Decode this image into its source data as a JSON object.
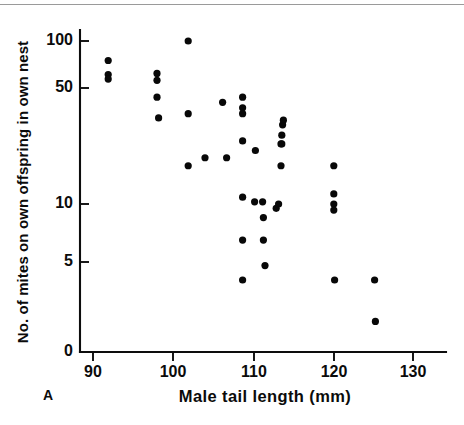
{
  "figure": {
    "panel_label": "A",
    "background_color": "#ffffff",
    "ink_color": "#080808",
    "rule_color": "#9a9a9a"
  },
  "chart_data": {
    "type": "scatter",
    "title": "",
    "xlabel": "Male tail length (mm)",
    "ylabel": "No. of mites on own offspring in own nest",
    "xlim": [
      88,
      132
    ],
    "ylim": [
      0,
      110
    ],
    "grid": false,
    "legend": null,
    "xticks": [
      90,
      100,
      110,
      120,
      130
    ],
    "xticklabels": [
      "90",
      "100",
      "110",
      "120",
      "130"
    ],
    "yticks": [
      0,
      5,
      10,
      50,
      100
    ],
    "yticklabels": [
      "0",
      "5",
      "10",
      "50",
      "100"
    ],
    "yscale": "log-like (0, 5, 10, 50, 100)",
    "marker": "filled-circle",
    "marker_color": "#080808",
    "x": [
      91.9,
      91.9,
      91.9,
      98.0,
      98.0,
      98.0,
      98.2,
      101.9,
      101.9,
      101.9,
      104.0,
      106.2,
      106.7,
      108.7,
      108.7,
      108.7,
      108.7,
      108.7,
      108.7,
      108.7,
      108.8,
      110.2,
      110.3,
      111.2,
      111.3,
      111.3,
      111.5,
      112.9,
      113.2,
      113.5,
      113.5,
      113.6,
      113.6,
      113.7,
      113.8,
      120.1,
      120.1,
      120.1,
      120.1,
      120.2,
      125.2,
      125.3
    ],
    "y": [
      75,
      61,
      57,
      62,
      56,
      44,
      33,
      100,
      35,
      17,
      19,
      41,
      19,
      44,
      38,
      35,
      24,
      11,
      6.5,
      4,
      11,
      10.3,
      21,
      10.3,
      8.5,
      6.5,
      4.8,
      9.5,
      10,
      17,
      23,
      23,
      26,
      30,
      32,
      17,
      11.5,
      10,
      9.3,
      4,
      4,
      1.7
    ],
    "points": [
      {
        "x": 91.9,
        "y": 75
      },
      {
        "x": 91.9,
        "y": 61
      },
      {
        "x": 91.9,
        "y": 57
      },
      {
        "x": 98.0,
        "y": 62
      },
      {
        "x": 98.0,
        "y": 56
      },
      {
        "x": 98.0,
        "y": 44
      },
      {
        "x": 98.2,
        "y": 33
      },
      {
        "x": 101.9,
        "y": 100
      },
      {
        "x": 101.9,
        "y": 35
      },
      {
        "x": 101.9,
        "y": 17
      },
      {
        "x": 104.0,
        "y": 19
      },
      {
        "x": 106.2,
        "y": 41
      },
      {
        "x": 106.7,
        "y": 19
      },
      {
        "x": 108.7,
        "y": 44
      },
      {
        "x": 108.7,
        "y": 38
      },
      {
        "x": 108.7,
        "y": 35
      },
      {
        "x": 108.7,
        "y": 24
      },
      {
        "x": 108.7,
        "y": 11
      },
      {
        "x": 108.7,
        "y": 6.5
      },
      {
        "x": 108.7,
        "y": 4
      },
      {
        "x": 110.2,
        "y": 10.3
      },
      {
        "x": 110.3,
        "y": 21
      },
      {
        "x": 111.2,
        "y": 10.3
      },
      {
        "x": 111.3,
        "y": 8.5
      },
      {
        "x": 111.3,
        "y": 6.5
      },
      {
        "x": 111.5,
        "y": 4.8
      },
      {
        "x": 112.9,
        "y": 9.5
      },
      {
        "x": 113.2,
        "y": 10
      },
      {
        "x": 113.5,
        "y": 17
      },
      {
        "x": 113.5,
        "y": 23
      },
      {
        "x": 113.6,
        "y": 23
      },
      {
        "x": 113.6,
        "y": 26
      },
      {
        "x": 113.7,
        "y": 30
      },
      {
        "x": 113.8,
        "y": 32
      },
      {
        "x": 120.1,
        "y": 17
      },
      {
        "x": 120.1,
        "y": 11.5
      },
      {
        "x": 120.1,
        "y": 10
      },
      {
        "x": 120.1,
        "y": 9.3
      },
      {
        "x": 120.2,
        "y": 4
      },
      {
        "x": 125.2,
        "y": 4
      },
      {
        "x": 125.3,
        "y": 1.7
      }
    ]
  }
}
